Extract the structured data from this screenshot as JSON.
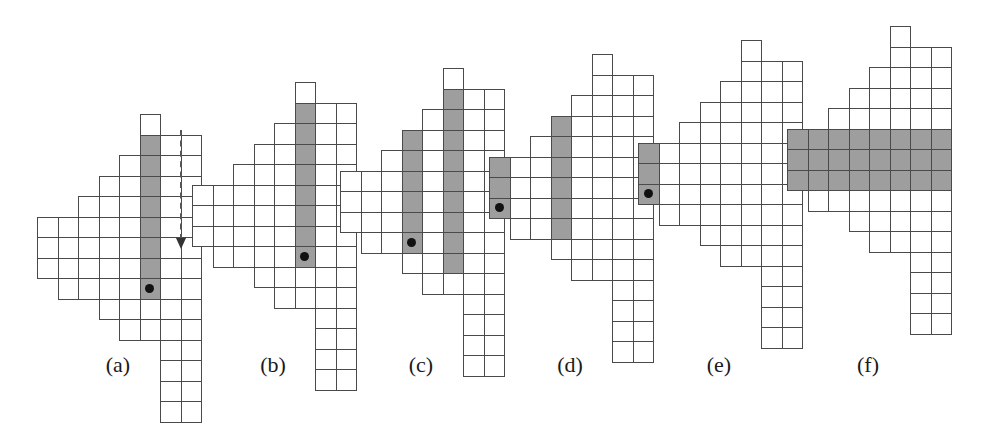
{
  "canvas": {
    "width": 981,
    "height": 400,
    "background": "#ffffff"
  },
  "style": {
    "cell_size": 20.5,
    "cell_border_color": "#4a4a4a",
    "shade_color": "#9e9e9e",
    "dot_color": "#111111",
    "caption_color": "#1a1a1a",
    "arrow_color": "#555555"
  },
  "shape": {
    "description": "skew staircase Young-diagram outline, shared by all six panels",
    "rows": [
      {
        "row": 0,
        "col_start": 5,
        "col_count": 1
      },
      {
        "row": 1,
        "col_start": 5,
        "col_count": 3
      },
      {
        "row": 2,
        "col_start": 4,
        "col_count": 4
      },
      {
        "row": 3,
        "col_start": 3,
        "col_count": 5
      },
      {
        "row": 4,
        "col_start": 2,
        "col_count": 6
      },
      {
        "row": 5,
        "col_start": 0,
        "col_count": 8
      },
      {
        "row": 6,
        "col_start": 0,
        "col_count": 8
      },
      {
        "row": 7,
        "col_start": 0,
        "col_count": 8
      },
      {
        "row": 8,
        "col_start": 1,
        "col_count": 7
      },
      {
        "row": 9,
        "col_start": 3,
        "col_count": 5
      },
      {
        "row": 10,
        "col_start": 4,
        "col_count": 4
      },
      {
        "row": 11,
        "col_start": 6,
        "col_count": 2
      },
      {
        "row": 12,
        "col_start": 6,
        "col_count": 2
      },
      {
        "row": 13,
        "col_start": 6,
        "col_count": 2
      },
      {
        "row": 14,
        "col_start": 6,
        "col_count": 2
      }
    ]
  },
  "panels": [
    {
      "id": "a",
      "caption": "(a)",
      "origin": {
        "x": 37,
        "y": 114
      },
      "caption_center_x": 118,
      "shaded": {
        "type": "column",
        "col": 5,
        "row_start": 1,
        "row_end": 8
      },
      "dot": {
        "col": 5,
        "row": 8
      },
      "arrow": {
        "x": 180,
        "y_start": 130,
        "y_end": 248,
        "direction": "down"
      }
    },
    {
      "id": "b",
      "caption": "(b)",
      "origin": {
        "x": 192,
        "y": 82
      },
      "caption_center_x": 273,
      "shaded": {
        "type": "column",
        "col": 5,
        "row_start": 1,
        "row_end": 8
      },
      "dot": {
        "col": 5,
        "row": 8
      },
      "arrow": null
    },
    {
      "id": "c",
      "caption": "(c)",
      "origin": {
        "x": 340,
        "y": 68
      },
      "caption_center_x": 421,
      "shaded": [
        {
          "type": "column",
          "col": 3,
          "row_start": 3,
          "row_end": 8
        },
        {
          "type": "column",
          "col": 5,
          "row_start": 1,
          "row_end": 9
        }
      ],
      "dot": {
        "col": 3,
        "row": 8
      },
      "arrow": null
    },
    {
      "id": "d",
      "caption": "(d)",
      "origin": {
        "x": 489,
        "y": 54
      },
      "caption_center_x": 570,
      "shaded": [
        {
          "type": "column",
          "col": 3,
          "row_start": 3,
          "row_end": 8
        },
        {
          "type": "column",
          "col": 0,
          "row_start": 5,
          "row_end": 7
        }
      ],
      "dot": {
        "col": 0,
        "row": 7
      },
      "arrow": null
    },
    {
      "id": "e",
      "caption": "(e)",
      "origin": {
        "x": 638,
        "y": 40
      },
      "caption_center_x": 719,
      "shaded": [
        {
          "type": "column",
          "col": 0,
          "row_start": 5,
          "row_end": 7
        }
      ],
      "dot": {
        "col": 0,
        "row": 7
      },
      "arrow": null
    },
    {
      "id": "f",
      "caption": "(f)",
      "origin": {
        "x": 787,
        "y": 26
      },
      "caption_center_x": 868,
      "shaded": [
        {
          "type": "row",
          "row": 5,
          "col_start": 0,
          "col_end": 7
        },
        {
          "type": "row",
          "row": 6,
          "col_start": 0,
          "col_end": 7
        },
        {
          "type": "row",
          "row": 7,
          "col_start": 0,
          "col_end": 7
        }
      ],
      "dot": null,
      "arrow": null
    }
  ],
  "captions_y": 352
}
